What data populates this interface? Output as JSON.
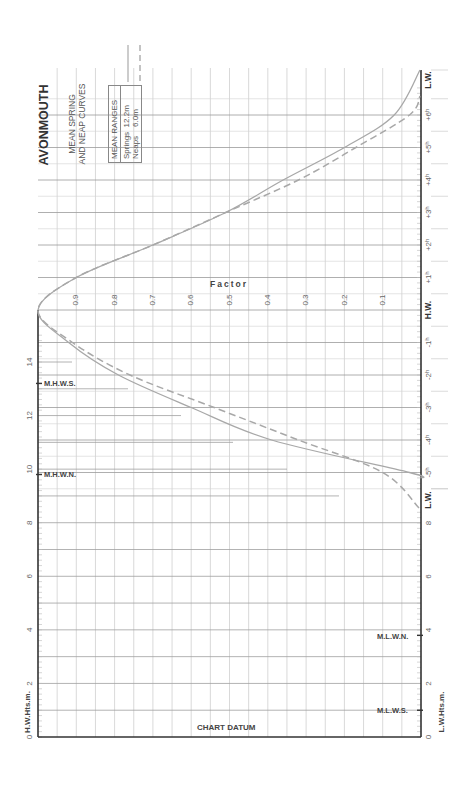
{
  "title": "AVONMOUTH",
  "subtitle_line1": "MEAN SPRING",
  "subtitle_line2": "AND NEAP CURVES",
  "legend": {
    "heading": "MEAN RANGES",
    "springs_label": "Springs",
    "springs_value": "12.2m",
    "neaps_label": "Neaps",
    "neaps_value": "6.0m"
  },
  "axes": {
    "factor_label": "Factor",
    "factor_ticks": [
      "0.9",
      "0.8",
      "0.7",
      "0.6",
      "0.5",
      "0.4",
      "0.3",
      "0.2",
      "0.1"
    ],
    "hw_heights_label": "H.W.Hts.m.",
    "lw_heights_label": "L.W.Hts.m.",
    "chart_datum_label": "CHART DATUM",
    "left_height_ticks": [
      "0",
      "2",
      "4",
      "6",
      "8",
      "10",
      "12",
      "14"
    ],
    "right_height_ticks": [
      "0",
      "2",
      "4",
      "6",
      "8"
    ],
    "hour_labels_after": [
      "+1ʰ",
      "+2ʰ",
      "+3ʰ",
      "+4ʰ",
      "+5ʰ",
      "+6ʰ"
    ],
    "hour_labels_before": [
      "-1ʰ",
      "-2ʰ",
      "-3ʰ",
      "-4ʰ",
      "-5ʰ"
    ],
    "hw_label": "H.W.",
    "lw_label_top": "L.W.",
    "lw_label_bottom": "L.W."
  },
  "markers": {
    "mhws": "M.H.W.S.",
    "mhwn": "M.H.W.N.",
    "mlwn": "M.L.W.N.",
    "mlws": "M.L.W.S."
  },
  "chart_data": {
    "type": "line",
    "xlabel": "Time from H.W. (hours)",
    "ylabel": "Factor",
    "ylim": [
      0,
      1
    ],
    "grid": true,
    "x": [
      -6,
      -5,
      -4,
      -3,
      -2,
      -1,
      0,
      1,
      2,
      3,
      4,
      5,
      6,
      6.5
    ],
    "series": [
      {
        "name": "Springs (range 12.2m)",
        "style": "solid",
        "values": [
          null,
          0.03,
          0.39,
          0.6,
          0.79,
          0.92,
          1.0,
          0.9,
          0.7,
          0.51,
          0.36,
          0.2,
          0.07,
          0.0
        ]
      },
      {
        "name": "Neaps (range 6.0m)",
        "style": "dashed",
        "values": [
          0.0,
          0.1,
          0.32,
          0.54,
          0.76,
          0.91,
          1.0,
          0.9,
          0.7,
          0.51,
          0.32,
          0.17,
          0.03,
          0.0
        ]
      }
    ],
    "height_scales": {
      "hw_heights_m": {
        "min": 0,
        "max": 14,
        "markers": {
          "M.H.W.S.": 13.2,
          "M.H.W.N.": 9.8
        }
      },
      "lw_heights_m": {
        "min": 0,
        "max": 8,
        "markers": {
          "M.L.W.N.": 3.8,
          "M.L.W.S.": 1.0
        }
      }
    },
    "mean_ranges": {
      "Springs": "12.2m",
      "Neaps": "6.0m"
    }
  }
}
